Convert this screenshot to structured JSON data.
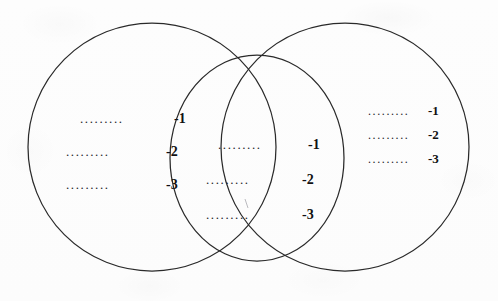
{
  "diagram": {
    "type": "venn",
    "background_color": "#fdfdfd",
    "stroke_color": "#2a2a2a",
    "text_color": "#111111",
    "shapes": [
      {
        "name": "left-circle",
        "shape": "circle",
        "cx": 152,
        "cy": 147,
        "r": 124,
        "fill": "none"
      },
      {
        "name": "right-circle",
        "shape": "circle",
        "cx": 345,
        "cy": 147,
        "r": 124,
        "fill": "none"
      },
      {
        "name": "middle-oval",
        "shape": "ellipse",
        "cx": 257,
        "cy": 158,
        "rx": 87,
        "ry": 103,
        "fill": "none"
      }
    ]
  },
  "sets": {
    "left": {
      "label": "left-set",
      "rows": [
        {
          "leader": ".........",
          "number": "-1"
        },
        {
          "leader": ".........",
          "number": "-2"
        },
        {
          "leader": ".........",
          "number": "-3"
        }
      ]
    },
    "middle": {
      "label": "intersection-set",
      "rows": [
        {
          "leader": ".........",
          "number": "-1"
        },
        {
          "leader": ".........",
          "number": "-2"
        },
        {
          "leader": ".........",
          "number": "-3"
        }
      ]
    },
    "right": {
      "label": "right-set",
      "rows": [
        {
          "leader": ".........",
          "number": "-1"
        },
        {
          "leader": ".........",
          "number": "-2"
        },
        {
          "leader": ".........",
          "number": "-3"
        }
      ]
    }
  }
}
